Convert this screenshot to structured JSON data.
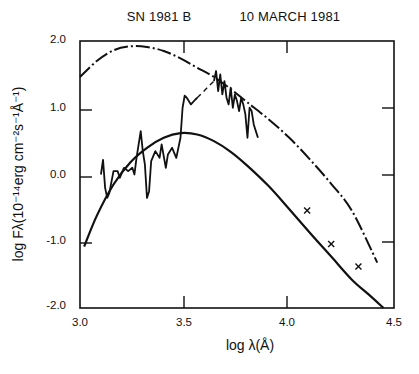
{
  "chart_data": {
    "type": "line",
    "title_parts": [
      "SN 1981 B",
      "10 MARCH 1981"
    ],
    "xlabel": "log λ(Å)",
    "ylabel_text": "log Fλ(10⁻¹⁴erg cm⁻²s⁻¹Å⁻¹)",
    "xlim": [
      3.0,
      4.5
    ],
    "ylim": [
      -2.0,
      2.0
    ],
    "x_ticks": [
      "3.0",
      "3.5",
      "4.0",
      "4.5"
    ],
    "y_ticks": [
      "2.0",
      "1.0",
      "0.0",
      "-1.0",
      "-2.0"
    ],
    "grid": false,
    "legend": null,
    "series": [
      {
        "name": "blackbody fit (dash-dot, upper)",
        "style": "dash-dot",
        "x": [
          3.0,
          3.08,
          3.16,
          3.24,
          3.32,
          3.4,
          3.48,
          3.56,
          3.64,
          3.72,
          3.8,
          3.9,
          4.0,
          4.1,
          4.2,
          4.3,
          4.42
        ],
        "y": [
          1.46,
          1.7,
          1.86,
          1.92,
          1.91,
          1.85,
          1.74,
          1.6,
          1.46,
          1.28,
          1.08,
          0.83,
          0.55,
          0.22,
          -0.14,
          -0.55,
          -1.32
        ]
      },
      {
        "name": "blackbody fit (solid, lower)",
        "style": "solid",
        "x": [
          3.02,
          3.08,
          3.16,
          3.24,
          3.32,
          3.4,
          3.48,
          3.56,
          3.64,
          3.72,
          3.8,
          3.9,
          4.0,
          4.1,
          4.2,
          4.3,
          4.38,
          4.45
        ],
        "y": [
          -1.08,
          -0.62,
          -0.15,
          0.18,
          0.4,
          0.55,
          0.62,
          0.6,
          0.5,
          0.34,
          0.13,
          -0.17,
          -0.52,
          -0.88,
          -1.23,
          -1.58,
          -1.8,
          -2.0
        ]
      },
      {
        "name": "observed spectrum (solid, noisy)",
        "style": "solid-noisy",
        "x": [
          3.1,
          3.11,
          3.12,
          3.13,
          3.14,
          3.16,
          3.18,
          3.19,
          3.21,
          3.23,
          3.25,
          3.26,
          3.27,
          3.29,
          3.3,
          3.31,
          3.32,
          3.33,
          3.34,
          3.36,
          3.38,
          3.39,
          3.41,
          3.42,
          3.44,
          3.46,
          3.48,
          3.49,
          3.5,
          3.51,
          3.53,
          3.55,
          3.56
        ],
        "y": [
          0.0,
          0.22,
          -0.2,
          -0.35,
          -0.28,
          0.05,
          0.05,
          -0.05,
          0.1,
          0.05,
          0.1,
          0.0,
          0.25,
          0.65,
          0.35,
          0.15,
          -0.35,
          -0.25,
          0.2,
          0.35,
          0.25,
          0.45,
          0.1,
          0.3,
          0.4,
          0.25,
          0.55,
          1.0,
          1.18,
          1.15,
          1.05,
          1.12,
          1.15
        ]
      },
      {
        "name": "spectrum gap (dashed)",
        "style": "dashed",
        "x": [
          3.56,
          3.64
        ],
        "y": [
          1.15,
          1.4
        ]
      },
      {
        "name": "observed spectrum (solid, red part)",
        "style": "solid-noisy",
        "x": [
          3.64,
          3.65,
          3.66,
          3.67,
          3.68,
          3.69,
          3.7,
          3.71,
          3.72,
          3.73,
          3.74,
          3.75,
          3.76,
          3.77,
          3.78,
          3.79,
          3.8,
          3.81,
          3.82,
          3.83,
          3.84,
          3.85
        ],
        "y": [
          1.4,
          1.55,
          1.25,
          1.5,
          1.2,
          1.4,
          1.15,
          1.05,
          1.3,
          1.0,
          1.2,
          1.1,
          0.95,
          1.15,
          1.05,
          0.9,
          0.55,
          1.0,
          0.95,
          0.75,
          0.65,
          0.55
        ]
      },
      {
        "name": "photometric points (crosses)",
        "style": "markers",
        "x": [
          4.085,
          4.2,
          4.33
        ],
        "y": [
          -0.54,
          -1.04,
          -1.38
        ]
      }
    ]
  }
}
